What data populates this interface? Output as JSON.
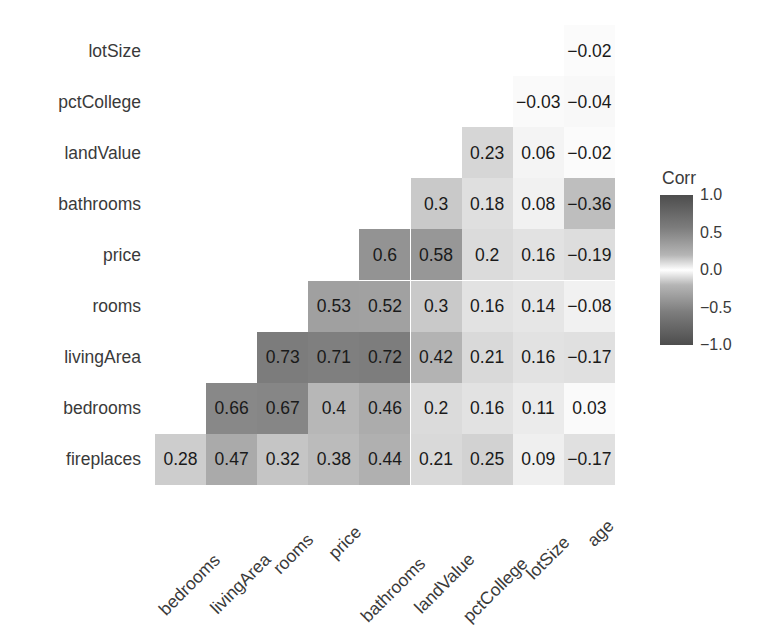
{
  "chart_data": {
    "type": "heatmap",
    "title": "",
    "subtitle": "",
    "xlabel": "",
    "ylabel": "",
    "grid": false,
    "legend_position": "right",
    "shape": "lower-triangle",
    "legend": {
      "title": "Corr",
      "ticks": [
        "1.0",
        "0.5",
        "0.0",
        "-0.5",
        "-1.0"
      ],
      "tick_values": [
        1.0,
        0.5,
        0.0,
        -0.5,
        -1.0
      ],
      "zlim": [
        -1.0,
        1.0
      ],
      "colors": {
        "high": "#4d4d4d",
        "mid": "#ffffff",
        "low": "#4d4d4d"
      }
    },
    "x_categories": [
      "bedrooms",
      "livingArea",
      "rooms",
      "price",
      "bathrooms",
      "landValue",
      "pctCollege",
      "lotSize",
      "age"
    ],
    "y_categories": [
      "lotSize",
      "pctCollege",
      "landValue",
      "bathrooms",
      "price",
      "rooms",
      "livingArea",
      "bedrooms",
      "fireplaces"
    ],
    "rows": [
      {
        "label": "lotSize",
        "cells": [
          {
            "x": "age",
            "value": -0.02,
            "text": "-0.02"
          }
        ]
      },
      {
        "label": "pctCollege",
        "cells": [
          {
            "x": "lotSize",
            "value": -0.03,
            "text": "-0.03"
          },
          {
            "x": "age",
            "value": -0.04,
            "text": "-0.04"
          }
        ]
      },
      {
        "label": "landValue",
        "cells": [
          {
            "x": "pctCollege",
            "value": 0.23,
            "text": "0.23"
          },
          {
            "x": "lotSize",
            "value": 0.06,
            "text": "0.06"
          },
          {
            "x": "age",
            "value": -0.02,
            "text": "-0.02"
          }
        ]
      },
      {
        "label": "bathrooms",
        "cells": [
          {
            "x": "landValue",
            "value": 0.3,
            "text": "0.3"
          },
          {
            "x": "pctCollege",
            "value": 0.18,
            "text": "0.18"
          },
          {
            "x": "lotSize",
            "value": 0.08,
            "text": "0.08"
          },
          {
            "x": "age",
            "value": -0.36,
            "text": "-0.36"
          }
        ]
      },
      {
        "label": "price",
        "cells": [
          {
            "x": "bathrooms",
            "value": 0.6,
            "text": "0.6"
          },
          {
            "x": "landValue",
            "value": 0.58,
            "text": "0.58"
          },
          {
            "x": "pctCollege",
            "value": 0.2,
            "text": "0.2"
          },
          {
            "x": "lotSize",
            "value": 0.16,
            "text": "0.16"
          },
          {
            "x": "age",
            "value": -0.19,
            "text": "-0.19"
          }
        ]
      },
      {
        "label": "rooms",
        "cells": [
          {
            "x": "price",
            "value": 0.53,
            "text": "0.53"
          },
          {
            "x": "bathrooms",
            "value": 0.52,
            "text": "0.52"
          },
          {
            "x": "landValue",
            "value": 0.3,
            "text": "0.3"
          },
          {
            "x": "pctCollege",
            "value": 0.16,
            "text": "0.16"
          },
          {
            "x": "lotSize",
            "value": 0.14,
            "text": "0.14"
          },
          {
            "x": "age",
            "value": -0.08,
            "text": "-0.08"
          }
        ]
      },
      {
        "label": "livingArea",
        "cells": [
          {
            "x": "rooms",
            "value": 0.73,
            "text": "0.73"
          },
          {
            "x": "price",
            "value": 0.71,
            "text": "0.71"
          },
          {
            "x": "bathrooms",
            "value": 0.72,
            "text": "0.72"
          },
          {
            "x": "landValue",
            "value": 0.42,
            "text": "0.42"
          },
          {
            "x": "pctCollege",
            "value": 0.21,
            "text": "0.21"
          },
          {
            "x": "lotSize",
            "value": 0.16,
            "text": "0.16"
          },
          {
            "x": "age",
            "value": -0.17,
            "text": "-0.17"
          }
        ]
      },
      {
        "label": "bedrooms",
        "cells": [
          {
            "x": "livingArea",
            "value": 0.66,
            "text": "0.66"
          },
          {
            "x": "rooms",
            "value": 0.67,
            "text": "0.67"
          },
          {
            "x": "price",
            "value": 0.4,
            "text": "0.4"
          },
          {
            "x": "bathrooms",
            "value": 0.46,
            "text": "0.46"
          },
          {
            "x": "landValue",
            "value": 0.2,
            "text": "0.2"
          },
          {
            "x": "pctCollege",
            "value": 0.16,
            "text": "0.16"
          },
          {
            "x": "lotSize",
            "value": 0.11,
            "text": "0.11"
          },
          {
            "x": "age",
            "value": 0.03,
            "text": "0.03"
          }
        ]
      },
      {
        "label": "fireplaces",
        "cells": [
          {
            "x": "bedrooms",
            "value": 0.28,
            "text": "0.28"
          },
          {
            "x": "livingArea",
            "value": 0.47,
            "text": "0.47"
          },
          {
            "x": "rooms",
            "value": 0.32,
            "text": "0.32"
          },
          {
            "x": "price",
            "value": 0.38,
            "text": "0.38"
          },
          {
            "x": "bathrooms",
            "value": 0.44,
            "text": "0.44"
          },
          {
            "x": "landValue",
            "value": 0.21,
            "text": "0.21"
          },
          {
            "x": "pctCollege",
            "value": 0.25,
            "text": "0.25"
          },
          {
            "x": "lotSize",
            "value": 0.09,
            "text": "0.09"
          },
          {
            "x": "age",
            "value": -0.17,
            "text": "-0.17"
          }
        ]
      }
    ]
  },
  "geometry": {
    "grid_left": 155,
    "grid_top": 25,
    "cell_width": 51.1,
    "cell_height": 51.1
  }
}
